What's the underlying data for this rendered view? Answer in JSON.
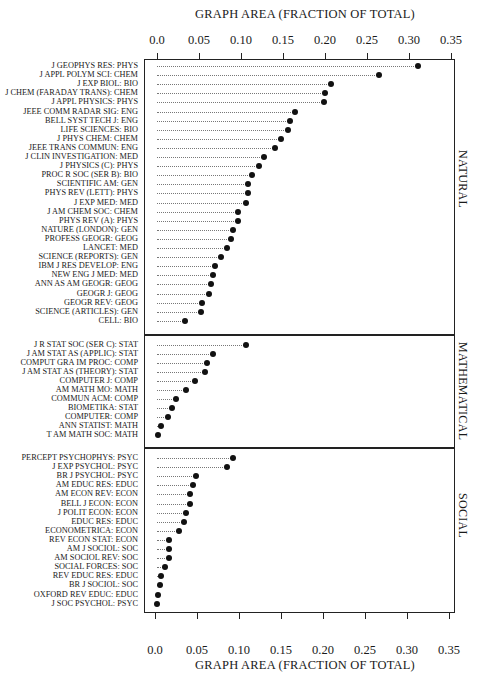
{
  "chart_data": {
    "type": "scatter",
    "subtype": "dot-plot",
    "title": "",
    "xlabel": "GRAPH AREA (FRACTION OF TOTAL)",
    "ylabel": "",
    "xlim": [
      0.0,
      0.35
    ],
    "x_ticks": [
      "0.0",
      "0.05",
      "0.10",
      "0.15",
      "0.20",
      "0.25",
      "0.30",
      "0.35"
    ],
    "grid": false,
    "groups": [
      {
        "name": "NATURAL",
        "points": [
          {
            "label": "J GEOPHYS RES: PHYS",
            "value": 0.311
          },
          {
            "label": "J APPL POLYM SCI: CHEM",
            "value": 0.264
          },
          {
            "label": "J EXP BIOL: BIO",
            "value": 0.207
          },
          {
            "label": "J CHEM (FARADAY TRANS): CHEM",
            "value": 0.2
          },
          {
            "label": "J APPL PHYSICS: PHYS",
            "value": 0.199
          },
          {
            "label": "JEEE COMM RADAR SIG: ENG",
            "value": 0.164
          },
          {
            "label": "BELL SYST TECH J: ENG",
            "value": 0.158
          },
          {
            "label": "LIFE SCIENCES: BIO",
            "value": 0.156
          },
          {
            "label": "J PHYS CHEM: CHEM",
            "value": 0.148
          },
          {
            "label": "JEEE TRANS COMMUN: ENG",
            "value": 0.14
          },
          {
            "label": "J CLIN INVESTIGATION: MED",
            "value": 0.127
          },
          {
            "label": "J PHYSICS (C): PHYS",
            "value": 0.122
          },
          {
            "label": "PROC R SOC (SER B): BIO",
            "value": 0.113
          },
          {
            "label": "SCIENTIFIC AM: GEN",
            "value": 0.108
          },
          {
            "label": "PHYS REV (LETT): PHYS",
            "value": 0.108
          },
          {
            "label": "J EXP MED: MED",
            "value": 0.106
          },
          {
            "label": "J AM CHEM SOC: CHEM",
            "value": 0.097
          },
          {
            "label": "PHYS REV (A): PHYS",
            "value": 0.096
          },
          {
            "label": "NATURE (LONDON): GEN",
            "value": 0.09
          },
          {
            "label": "PROFESS GEOGR: GEOG",
            "value": 0.088
          },
          {
            "label": "LANCET: MED",
            "value": 0.083
          },
          {
            "label": "SCIENCE (REPORTS): GEN",
            "value": 0.076
          },
          {
            "label": "IBM J RES DEVELOP: ENG",
            "value": 0.069
          },
          {
            "label": "NEW ENG J MED: MED",
            "value": 0.067
          },
          {
            "label": "ANN AS AM GEOGR: GEOG",
            "value": 0.064
          },
          {
            "label": "GEOGR J: GEOG",
            "value": 0.062
          },
          {
            "label": "GEOGR REV: GEOG",
            "value": 0.054
          },
          {
            "label": "SCIENCE (ARTICLES): GEN",
            "value": 0.052
          },
          {
            "label": "CELL: BIO",
            "value": 0.033
          }
        ]
      },
      {
        "name": "MATHEMATICAL",
        "points": [
          {
            "label": "J R STAT SOC (SER C): STAT",
            "value": 0.106
          },
          {
            "label": "J AM STAT AS (APPLIC): STAT",
            "value": 0.067
          },
          {
            "label": "COMPUT GRA IM PROC: COMP",
            "value": 0.06
          },
          {
            "label": "J AM STAT AS (THEORY): STAT",
            "value": 0.057
          },
          {
            "label": "COMPUTER J: COMP",
            "value": 0.045
          },
          {
            "label": "AM MATH MO: MATH",
            "value": 0.035
          },
          {
            "label": "COMMUN ACM: COMP",
            "value": 0.023
          },
          {
            "label": "BIOMETIKA: STAT",
            "value": 0.018
          },
          {
            "label": "COMPUTER: COMP",
            "value": 0.013
          },
          {
            "label": "ANN STATIST: MATH",
            "value": 0.005
          },
          {
            "label": "T AM MATH SOC: MATH",
            "value": 0.001
          }
        ]
      },
      {
        "name": "SOCIAL",
        "points": [
          {
            "label": "PERCEPT PSYCHOPHYS: PSYC",
            "value": 0.09
          },
          {
            "label": "J EXP PSYCHOL: PSYC",
            "value": 0.083
          },
          {
            "label": "BR J PSYCHOL: PSYC",
            "value": 0.046
          },
          {
            "label": "AM EDUC RES: EDUC",
            "value": 0.043
          },
          {
            "label": "AM ECON REV: ECON",
            "value": 0.039
          },
          {
            "label": "BELL J ECON: ECON",
            "value": 0.039
          },
          {
            "label": "J POLIT ECON: ECON",
            "value": 0.035
          },
          {
            "label": "EDUC RES: EDUC",
            "value": 0.032
          },
          {
            "label": "ECONOMETRICA: ECON",
            "value": 0.026
          },
          {
            "label": "REV ECON STAT: ECON",
            "value": 0.014
          },
          {
            "label": "AM J SOCIOL: SOC",
            "value": 0.014
          },
          {
            "label": "AM SOCIOL REV: SOC",
            "value": 0.014
          },
          {
            "label": "SOCIAL FORCES: SOC",
            "value": 0.01
          },
          {
            "label": "REV EDUC RES: EDUC",
            "value": 0.005
          },
          {
            "label": "BR J SOCIOL: SOC",
            "value": 0.004
          },
          {
            "label": "OXFORD REV EDUC: EDUC",
            "value": 0.001
          },
          {
            "label": "J SOC PSYCHOL: PSYC",
            "value": 0.0
          }
        ]
      }
    ]
  },
  "axes": {
    "top_title": "GRAPH AREA (FRACTION OF TOTAL)",
    "bottom_title": "GRAPH AREA (FRACTION OF TOTAL)"
  }
}
